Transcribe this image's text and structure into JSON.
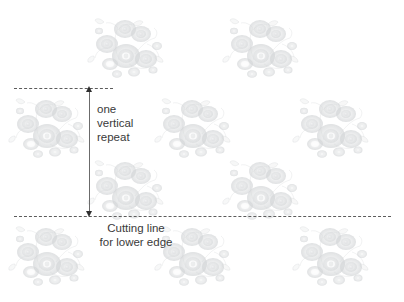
{
  "diagram": {
    "background_color": "#ffffff",
    "width": 404,
    "height": 302,
    "labels": {
      "vertical_repeat": "one\nvertical\nrepeat",
      "cutting_line": "Cutting line\nfor lower edge"
    },
    "colors": {
      "text": "#3a3a3a",
      "dash_line": "#5c5c5c",
      "arrow_line": "#6b6b6b",
      "arrow_head": "#2f2f2f",
      "motif": "#b9bdc0"
    },
    "guides": [
      {
        "name": "upper-repeat-line",
        "y": 88,
        "x1": 14,
        "x2": 113
      },
      {
        "name": "cutting-line-lower-edge",
        "y": 216,
        "x1": 14,
        "x2": 391
      }
    ],
    "measure": {
      "name": "one-vertical-repeat",
      "x": 89,
      "y_top": 88,
      "y_bottom": 216,
      "length_px": 128
    },
    "motifs": [
      {
        "row": 1,
        "x": 85,
        "y": 8
      },
      {
        "row": 1,
        "x": 220,
        "y": 8
      },
      {
        "row": 2,
        "x": 8,
        "y": 88
      },
      {
        "row": 2,
        "x": 153,
        "y": 88
      },
      {
        "row": 2,
        "x": 290,
        "y": 88
      },
      {
        "row": 3,
        "x": 85,
        "y": 150
      },
      {
        "row": 3,
        "x": 220,
        "y": 150
      },
      {
        "row": 4,
        "x": 8,
        "y": 216
      },
      {
        "row": 4,
        "x": 153,
        "y": 216
      },
      {
        "row": 4,
        "x": 290,
        "y": 216
      }
    ]
  }
}
